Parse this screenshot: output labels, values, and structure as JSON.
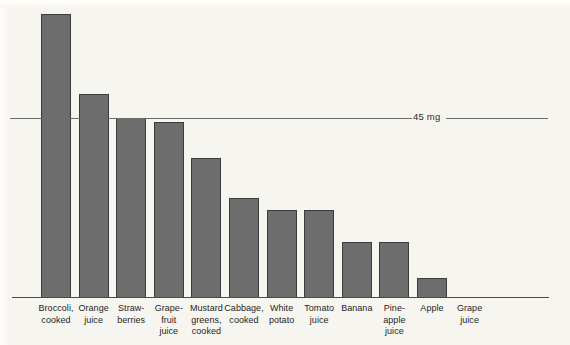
{
  "figure": {
    "background_color": "#f7f5ef",
    "bar_fill_color": "#6d6d6d",
    "bar_stroke_color": "#3c3c3c",
    "axis_color": "#4a4a4a"
  },
  "reference_line": {
    "label": "45 mg",
    "value": 45
  },
  "chart_data": {
    "type": "bar",
    "title": "",
    "subtitle": "",
    "xlabel": "",
    "ylabel": "",
    "ylim": [
      0,
      75
    ],
    "grid": false,
    "legend": null,
    "unit": "mg",
    "categories": [
      "Broccoli,\ncooked",
      "Orange\njuice",
      "Straw-\nberries",
      "Grape-\nfruit\njuice",
      "Mustard\ngreens,\ncooked",
      "Cabbage,\ncooked",
      "White\npotato",
      "Tomato\njuice",
      "Banana",
      "Pine-\napple\njuice",
      "Apple",
      "Grape\njuice"
    ],
    "values": [
      71,
      51,
      45,
      44,
      35,
      25,
      22,
      22,
      14,
      14,
      5,
      0
    ],
    "annotations": [
      {
        "type": "hline",
        "value": 45,
        "label": "45 mg"
      }
    ]
  }
}
